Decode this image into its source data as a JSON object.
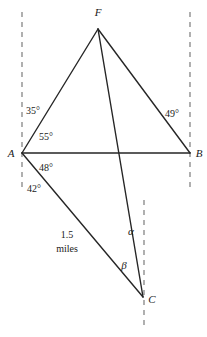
{
  "figure": {
    "background_color": "#ffffff",
    "line_color": "#262626",
    "dashed_color": "#6f6f6f",
    "text_color": "#1a1a1a",
    "vertices": [
      {
        "id": "F",
        "label": "F",
        "x": 98,
        "y": 29,
        "label_x": 98,
        "label_y": 16
      },
      {
        "id": "A",
        "label": "A",
        "x": 22,
        "y": 153,
        "label_x": 11,
        "label_y": 157
      },
      {
        "id": "B",
        "label": "B",
        "x": 190,
        "y": 153,
        "label_x": 199,
        "label_y": 157
      },
      {
        "id": "C",
        "label": "C",
        "x": 143,
        "y": 297,
        "label_x": 152,
        "label_y": 303
      }
    ],
    "segments": [
      {
        "id": "AF",
        "from": "A",
        "to": "F"
      },
      {
        "id": "FB",
        "from": "F",
        "to": "B"
      },
      {
        "id": "AB",
        "from": "A",
        "to": "B"
      },
      {
        "id": "FC",
        "from": "F",
        "to": "C"
      },
      {
        "id": "AC",
        "from": "A",
        "to": "C"
      },
      {
        "id": "BC_none",
        "from": "B",
        "to": "B"
      }
    ],
    "dashed_lines": [
      {
        "id": "dashed-through-A",
        "x1": 22,
        "y1": 12,
        "x2": 22,
        "y2": 190
      },
      {
        "id": "dashed-through-B",
        "x1": 190,
        "y1": 12,
        "x2": 190,
        "y2": 190
      },
      {
        "id": "dashed-through-C",
        "x1": 144,
        "y1": 200,
        "x2": 144,
        "y2": 325
      }
    ],
    "angle_labels": [
      {
        "id": "angle-35",
        "text": "35°",
        "x": 33,
        "y": 114
      },
      {
        "id": "angle-55",
        "text": "55°",
        "x": 46,
        "y": 140
      },
      {
        "id": "angle-49",
        "text": "49°",
        "x": 172,
        "y": 117
      },
      {
        "id": "angle-48",
        "text": "48°",
        "x": 46,
        "y": 171
      },
      {
        "id": "angle-42",
        "text": "42°",
        "x": 34,
        "y": 192
      }
    ],
    "greek_labels": [
      {
        "id": "angle-alpha",
        "text": "α",
        "x": 131,
        "y": 235
      },
      {
        "id": "angle-beta",
        "text": "β",
        "x": 124,
        "y": 269
      }
    ],
    "measure_label": {
      "id": "distance-1-5-miles",
      "line1": "1.5",
      "line2": "miles",
      "x": 67,
      "y1": 238,
      "y2": 252
    }
  }
}
